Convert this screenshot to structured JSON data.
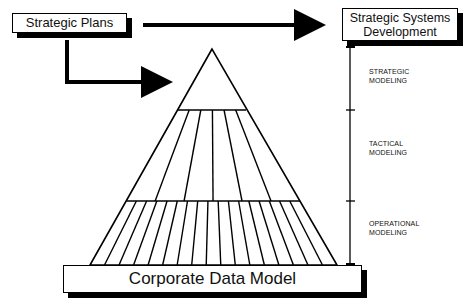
{
  "diagram": {
    "source_box": {
      "label": "Strategic Plans"
    },
    "target_box": {
      "line1": "Strategic Systems",
      "line2": "Development"
    },
    "base_box": {
      "label": "Corporate Data Model"
    },
    "levels": [
      {
        "line1": "STRATEGIC",
        "line2": "MODELING"
      },
      {
        "line1": "TACTICAL",
        "line2": "MODELING"
      },
      {
        "line1": "OPERATIONAL",
        "line2": "MODELING"
      }
    ],
    "pyramid": {
      "apex": [
        212,
        49
      ],
      "tier_lines_y": [
        110,
        201
      ],
      "base_y": 265,
      "base_x": [
        90,
        337
      ],
      "middle_tier_divisions": 6,
      "bottom_tier_divisions": 17
    },
    "colors": {
      "line": "#000000",
      "background": "#ffffff"
    }
  }
}
